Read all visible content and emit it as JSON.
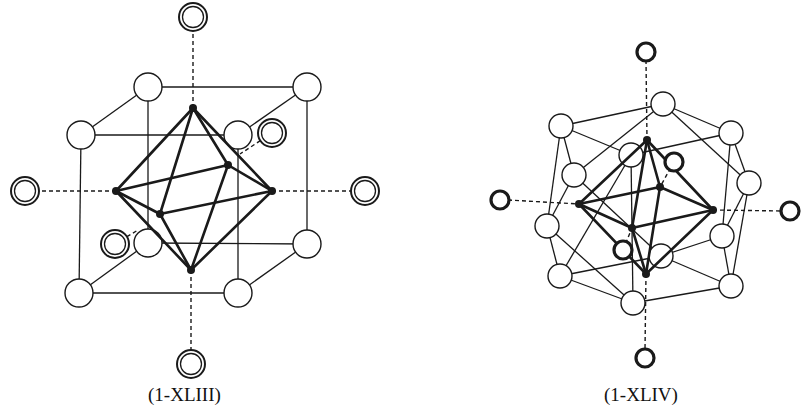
{
  "figures": [
    {
      "id": "left",
      "caption": "(1-XLIII)",
      "description": "Octahedral cluster inside a cube of open spheres, with six outer double-ring ligands on dashed axes",
      "colors": {
        "line": "#1a1a1a",
        "fill": "#ffffff"
      },
      "cube_nodes": [
        [
          148,
          87
        ],
        [
          307,
          87
        ],
        [
          81,
          135
        ],
        [
          238,
          135
        ],
        [
          79,
          293
        ],
        [
          238,
          293
        ],
        [
          148,
          243
        ],
        [
          307,
          244
        ]
      ],
      "cube_edges": [
        [
          0,
          1
        ],
        [
          2,
          3
        ],
        [
          4,
          5
        ],
        [
          6,
          7
        ],
        [
          0,
          2
        ],
        [
          1,
          3
        ],
        [
          6,
          4
        ],
        [
          7,
          5
        ],
        [
          0,
          6
        ],
        [
          1,
          7
        ],
        [
          2,
          4
        ],
        [
          3,
          5
        ]
      ],
      "octa_nodes": [
        [
          193,
          108
        ],
        [
          191,
          270
        ],
        [
          116,
          191
        ],
        [
          272,
          191
        ],
        [
          228,
          165
        ],
        [
          160,
          214
        ]
      ],
      "octa_edges": [
        [
          0,
          2
        ],
        [
          0,
          3
        ],
        [
          0,
          4
        ],
        [
          0,
          5
        ],
        [
          1,
          2
        ],
        [
          1,
          3
        ],
        [
          1,
          4
        ],
        [
          1,
          5
        ],
        [
          2,
          4
        ],
        [
          4,
          3
        ],
        [
          3,
          5
        ],
        [
          5,
          2
        ]
      ],
      "ring_ligands": [
        [
          193,
          17
        ],
        [
          191,
          364
        ],
        [
          25,
          191
        ],
        [
          365,
          191
        ],
        [
          272,
          133
        ],
        [
          115,
          244
        ]
      ],
      "axis_lines": [
        [
          [
            193,
            27
          ],
          [
            193,
            108
          ]
        ],
        [
          [
            191,
            270
          ],
          [
            191,
            354
          ]
        ],
        [
          [
            35,
            191
          ],
          [
            116,
            191
          ]
        ],
        [
          [
            272,
            191
          ],
          [
            355,
            191
          ]
        ],
        [
          [
            272,
            133
          ],
          [
            240,
            154
          ]
        ],
        [
          [
            115,
            244
          ],
          [
            138,
            230
          ]
        ]
      ]
    },
    {
      "id": "right",
      "caption": "(1-XLIV)",
      "description": "Octahedral cluster inside a cuboctahedron of open spheres, with six outer bold-ring ligands on dashed axes",
      "colors": {
        "line": "#1a1a1a",
        "fill": "#ffffff"
      },
      "cubo_nodes": [
        [
          663,
          104
        ],
        [
          561,
          126
        ],
        [
          731,
          133
        ],
        [
          574,
          175
        ],
        [
          749,
          183
        ],
        [
          547,
          226
        ],
        [
          722,
          236
        ],
        [
          560,
          276
        ],
        [
          731,
          286
        ],
        [
          633,
          303
        ],
        [
          661,
          256
        ],
        [
          631,
          155
        ]
      ],
      "cubo_edges": [
        [
          0,
          1
        ],
        [
          0,
          2
        ],
        [
          0,
          3
        ],
        [
          0,
          4
        ],
        [
          1,
          3
        ],
        [
          1,
          5
        ],
        [
          1,
          11
        ],
        [
          2,
          4
        ],
        [
          2,
          6
        ],
        [
          2,
          11
        ],
        [
          3,
          5
        ],
        [
          3,
          10
        ],
        [
          4,
          6
        ],
        [
          4,
          8
        ],
        [
          5,
          7
        ],
        [
          6,
          8
        ],
        [
          6,
          10
        ],
        [
          7,
          9
        ],
        [
          7,
          10
        ],
        [
          8,
          9
        ],
        [
          8,
          10
        ],
        [
          9,
          11
        ],
        [
          5,
          9
        ],
        [
          7,
          11
        ]
      ],
      "octa_nodes": [
        [
          647,
          140
        ],
        [
          646,
          274
        ],
        [
          579,
          204
        ],
        [
          713,
          210
        ],
        [
          660,
          187
        ],
        [
          632,
          228
        ]
      ],
      "octa_edges": [
        [
          0,
          2
        ],
        [
          0,
          3
        ],
        [
          0,
          4
        ],
        [
          0,
          5
        ],
        [
          1,
          2
        ],
        [
          1,
          3
        ],
        [
          1,
          4
        ],
        [
          1,
          5
        ],
        [
          2,
          4
        ],
        [
          4,
          3
        ],
        [
          3,
          5
        ],
        [
          5,
          2
        ]
      ],
      "ring_ligands": [
        [
          646,
          52
        ],
        [
          645,
          358
        ],
        [
          500,
          200
        ],
        [
          790,
          211
        ],
        [
          674,
          162
        ],
        [
          623,
          250
        ]
      ],
      "axis_lines": [
        [
          [
            646,
            60
          ],
          [
            647,
            140
          ]
        ],
        [
          [
            646,
            274
          ],
          [
            645,
            350
          ]
        ],
        [
          [
            508,
            200
          ],
          [
            579,
            204
          ]
        ],
        [
          [
            713,
            210
          ],
          [
            782,
            211
          ]
        ],
        [
          [
            674,
            162
          ],
          [
            660,
            187
          ]
        ],
        [
          [
            623,
            250
          ],
          [
            632,
            228
          ]
        ]
      ]
    }
  ]
}
